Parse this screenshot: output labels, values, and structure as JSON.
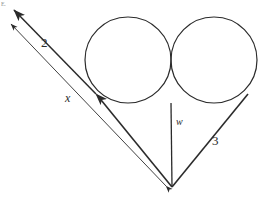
{
  "figure": {
    "background_color": "#ffffff",
    "stroke_color": "#2b2b2b",
    "labels": {
      "segment_2": "2",
      "segment_x": "x",
      "segment_w": "w",
      "segment_3": "3",
      "corner_mark": "E."
    },
    "geometry": {
      "vertex": {
        "x": 172,
        "y": 187
      },
      "left_arm_tangent": {
        "x": 97,
        "y": 95
      },
      "right_arm_tangent": {
        "x": 244,
        "y": 100
      },
      "circles": [
        {
          "name": "left-circle",
          "cx": 128,
          "cy": 60,
          "r": 43
        },
        {
          "name": "right-circle",
          "cx": 214,
          "cy": 60,
          "r": 43
        }
      ],
      "vertical_segment": {
        "x": 171,
        "y_top": 103,
        "y_bottom": 187
      },
      "arrow_2": {
        "x1": 98,
        "y1": 96,
        "x2": 12,
        "y2": 8
      },
      "arrow_x": {
        "x1": 167,
        "y1": 186,
        "x2": 9,
        "y2": 22
      }
    }
  }
}
